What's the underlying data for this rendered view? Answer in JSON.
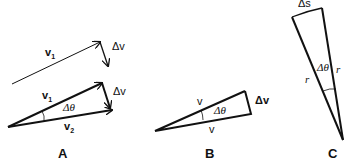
{
  "figure": {
    "panels": [
      {
        "id": "A",
        "label": "A",
        "top_vector_label": "v",
        "top_vector_sub": "1",
        "top_delta_label": "Δv",
        "v1_label": "v",
        "v1_sub": "1",
        "v2_label": "v",
        "v2_sub": "2",
        "delta_v_label": "Δv",
        "angle_label": "Δθ"
      },
      {
        "id": "B",
        "label": "B",
        "upper_side_label": "v",
        "lower_side_label": "v",
        "delta_v_label": "Δv",
        "angle_label": "Δθ"
      },
      {
        "id": "C",
        "label": "C",
        "arc_label": "Δs",
        "left_radius_label": "r",
        "right_radius_label": "r",
        "angle_label": "Δθ"
      }
    ],
    "colors": {
      "stroke": "#111111",
      "background": "#ffffff"
    }
  }
}
